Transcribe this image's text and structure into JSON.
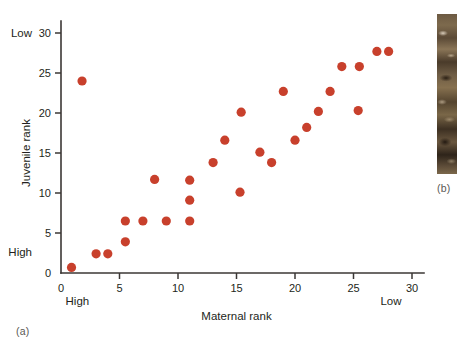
{
  "figure": {
    "panel_a_tag": "(a)",
    "panel_b_tag": "(b)"
  },
  "chart_data": {
    "type": "scatter",
    "title": "",
    "xlabel": "Maternal rank",
    "ylabel": "Juvenile rank",
    "xlim": [
      0,
      31
    ],
    "ylim": [
      0,
      31
    ],
    "xticks": [
      0,
      5,
      10,
      15,
      20,
      25,
      30
    ],
    "xtick_labels": [
      "0",
      "5",
      "10",
      "15",
      "20",
      "25",
      "30"
    ],
    "yticks": [
      0,
      5,
      10,
      15,
      20,
      25,
      30
    ],
    "ytick_labels": [
      "0",
      "5",
      "10",
      "15",
      "20",
      "25",
      "30"
    ],
    "grid": false,
    "legend": "none",
    "x_axis_low_end_label": "High",
    "x_axis_high_end_label": "Low",
    "y_axis_low_end_label": "High",
    "y_axis_high_end_label": "Low",
    "marker_color": "#c8402c",
    "marker_size": 4.6,
    "points": [
      {
        "x": 0.9,
        "y": 0.7
      },
      {
        "x": 1.8,
        "y": 24.0
      },
      {
        "x": 3.0,
        "y": 2.4
      },
      {
        "x": 4.0,
        "y": 2.4
      },
      {
        "x": 5.5,
        "y": 3.9
      },
      {
        "x": 5.5,
        "y": 6.5
      },
      {
        "x": 7.0,
        "y": 6.5
      },
      {
        "x": 8.0,
        "y": 11.7
      },
      {
        "x": 9.0,
        "y": 6.5
      },
      {
        "x": 11.0,
        "y": 6.5
      },
      {
        "x": 11.0,
        "y": 9.1
      },
      {
        "x": 11.0,
        "y": 11.6
      },
      {
        "x": 13.0,
        "y": 13.8
      },
      {
        "x": 14.0,
        "y": 16.6
      },
      {
        "x": 15.3,
        "y": 10.1
      },
      {
        "x": 15.4,
        "y": 20.1
      },
      {
        "x": 17.0,
        "y": 15.1
      },
      {
        "x": 18.0,
        "y": 13.8
      },
      {
        "x": 19.0,
        "y": 22.7
      },
      {
        "x": 20.0,
        "y": 16.6
      },
      {
        "x": 21.0,
        "y": 18.2
      },
      {
        "x": 22.0,
        "y": 20.2
      },
      {
        "x": 23.0,
        "y": 22.7
      },
      {
        "x": 24.0,
        "y": 25.8
      },
      {
        "x": 25.4,
        "y": 20.3
      },
      {
        "x": 25.5,
        "y": 25.8
      },
      {
        "x": 27.0,
        "y": 27.7
      },
      {
        "x": 28.0,
        "y": 27.7
      }
    ]
  }
}
